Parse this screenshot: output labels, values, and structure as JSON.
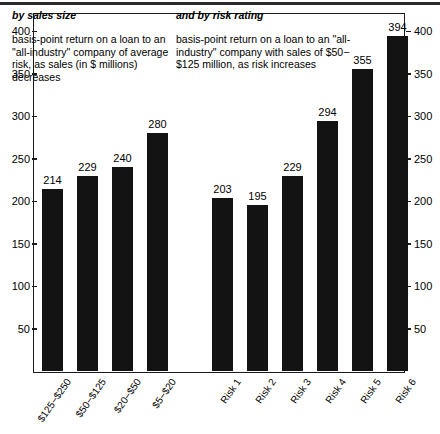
{
  "figure": {
    "panels": [
      {
        "title": "by sales size",
        "description": "basis-point return on a loan to an \"all-industry\" company of average risk, as sales (in $ millions) decreases"
      },
      {
        "title": "and by risk rating",
        "description": "basis-point return on a loan to an \"all-industry\" company with sales of $50−$125 million, as risk increases"
      }
    ],
    "axis_ticks": [
      400,
      350,
      300,
      250,
      200,
      150,
      100,
      50
    ],
    "colors": {
      "bar": "#131313",
      "frame": "#1a1a1a",
      "background": "#ffffff",
      "text": "#000000"
    }
  },
  "chart_data": {
    "type": "bar",
    "title": "",
    "subtitle": "",
    "xlabel": "",
    "ylabel": "",
    "ylim": [
      0,
      420
    ],
    "grid": false,
    "legend": "none",
    "axis_ticks_left": [
      400,
      350,
      300,
      250,
      200,
      150,
      100,
      50
    ],
    "axis_ticks_right": [
      400,
      350,
      300,
      250,
      200,
      150,
      100,
      50
    ],
    "groups": [
      {
        "name": "by sales size",
        "categories": [
          "$125−$250",
          "$50−$125",
          "$20−$50",
          "$5−$20"
        ],
        "values": [
          214,
          229,
          240,
          280
        ]
      },
      {
        "name": "and by risk rating",
        "categories": [
          "Risk 1",
          "Risk 2",
          "Risk 3",
          "Risk 4",
          "Risk 5",
          "Risk 6"
        ],
        "values": [
          203,
          195,
          229,
          294,
          355,
          394
        ]
      }
    ],
    "categories": [
      "$125−$250",
      "$50−$125",
      "$20−$50",
      "$5−$20",
      "Risk 1",
      "Risk 2",
      "Risk 3",
      "Risk 4",
      "Risk 5",
      "Risk 6"
    ],
    "values": [
      214,
      229,
      240,
      280,
      203,
      195,
      229,
      294,
      355,
      394
    ]
  }
}
